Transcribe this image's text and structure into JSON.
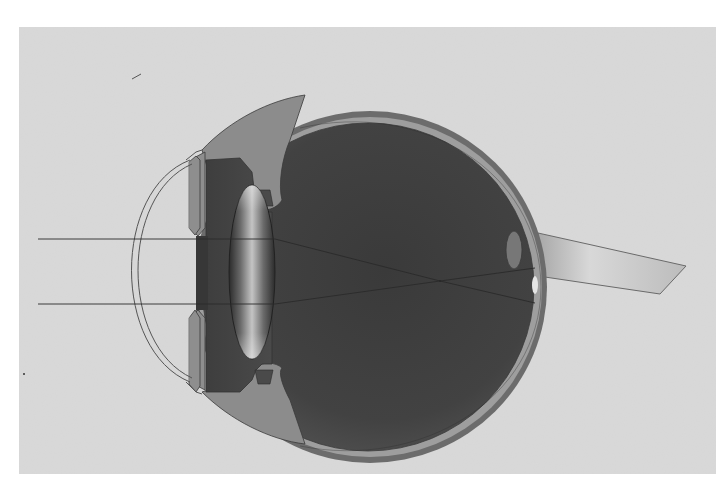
{
  "diagram": {
    "type": "eye-cross-section",
    "colors": {
      "page_bg": "#ffffff",
      "panel_bg": "#d9d9d9",
      "sclera": "#6e6e6e",
      "choroid_band": "#a0a0a0",
      "vitreous_dark": "#3c3c3c",
      "vitreous_light": "#5a5a5a",
      "ciliary_body": "#8a8a8a",
      "iris": "#8f8f8f",
      "aqueous": "#4a4a4a",
      "lens_edge": "#2f2f2f",
      "lens_highlight": "#bdbdbd",
      "cornea_line": "#555555",
      "optic_nerve_light": "#e6e6e6",
      "optic_nerve_dark": "#9a9a9a",
      "macula": "#787878",
      "ray": "#2a2a2a"
    },
    "parts": [
      {
        "name": "cornea"
      },
      {
        "name": "iris"
      },
      {
        "name": "ciliary-body"
      },
      {
        "name": "lens"
      },
      {
        "name": "vitreous-body"
      },
      {
        "name": "sclera"
      },
      {
        "name": "retina"
      },
      {
        "name": "macula"
      },
      {
        "name": "optic-disc"
      },
      {
        "name": "optic-nerve"
      }
    ],
    "rays": [
      {
        "name": "upper-ray",
        "start": [
          38,
          239
        ],
        "lens": [
          275,
          239
        ],
        "focus": [
          440,
          281
        ],
        "end": [
          535,
          303
        ]
      },
      {
        "name": "lower-ray",
        "start": [
          38,
          304
        ],
        "lens": [
          275,
          304
        ],
        "focus": [
          440,
          281
        ],
        "end": [
          535,
          268
        ]
      }
    ],
    "focal_point": [
      440,
      281
    ]
  }
}
